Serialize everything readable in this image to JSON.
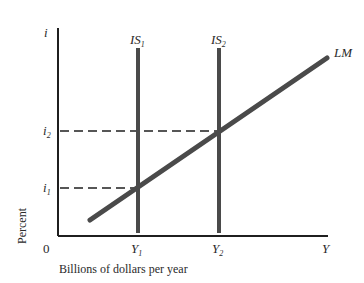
{
  "diagram": {
    "type": "IS-LM",
    "y_axis": {
      "label": "i",
      "title": "Percent"
    },
    "x_axis": {
      "label": "Y",
      "title": "Billions of dollars per year",
      "origin": "0"
    },
    "curves": {
      "is1": {
        "label": "IS",
        "sub": "1"
      },
      "is2": {
        "label": "IS",
        "sub": "2"
      },
      "lm": {
        "label": "LM"
      }
    },
    "ticks": {
      "i1": {
        "label": "i",
        "sub": "1"
      },
      "i2": {
        "label": "i",
        "sub": "2"
      },
      "y1": {
        "label": "Y",
        "sub": "1"
      },
      "y2": {
        "label": "Y",
        "sub": "2"
      }
    },
    "colors": {
      "axis": "#1f1f1f",
      "curve": "#4a4a4a",
      "dash": "#1f1f1f",
      "text": "#2a2a2a"
    }
  }
}
